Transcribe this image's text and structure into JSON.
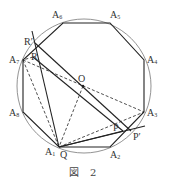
{
  "figure": {
    "caption": "図 2",
    "colors": {
      "line": "#222222",
      "circle": "#777777",
      "label": "#333333",
      "background": "#ffffff"
    },
    "circle": {
      "cx": 84,
      "cy": 86,
      "r": 67
    },
    "center": {
      "name": "O",
      "x": 83,
      "y": 86,
      "label_x": 78,
      "label_y": 82
    },
    "octagon": {
      "vertices": [
        {
          "name": "A1",
          "base": "A",
          "sub": "1",
          "x": 59,
          "y": 147,
          "lx": 45,
          "ly": 155
        },
        {
          "name": "A2",
          "base": "A",
          "sub": "2",
          "x": 110,
          "y": 147,
          "lx": 110,
          "ly": 158
        },
        {
          "name": "A3",
          "base": "A",
          "sub": "3",
          "x": 144,
          "y": 112,
          "lx": 147,
          "ly": 116
        },
        {
          "name": "A4",
          "base": "A",
          "sub": "4",
          "x": 144,
          "y": 60,
          "lx": 147,
          "ly": 63
        },
        {
          "name": "A5",
          "base": "A",
          "sub": "5",
          "x": 110,
          "y": 23,
          "lx": 110,
          "ly": 18
        },
        {
          "name": "A6",
          "base": "A",
          "sub": "6",
          "x": 63,
          "y": 23,
          "lx": 52,
          "ly": 18
        },
        {
          "name": "A7",
          "base": "A",
          "sub": "7",
          "x": 23,
          "y": 60,
          "lx": 9,
          "ly": 63
        },
        {
          "name": "A8",
          "base": "A",
          "sub": "8",
          "x": 23,
          "y": 112,
          "lx": 9,
          "ly": 116
        }
      ]
    },
    "points": [
      {
        "name": "Q",
        "x": 59,
        "y": 147,
        "label": "Q",
        "lx": 60,
        "ly": 158
      },
      {
        "name": "R'",
        "x": 35,
        "y": 43,
        "label": "R′",
        "lx": 24,
        "ly": 45
      },
      {
        "name": "R",
        "x": 33,
        "y": 57,
        "label": "R",
        "lx": 31,
        "ly": 60
      },
      {
        "name": "P",
        "x": 123,
        "y": 128,
        "label": "P",
        "lx": 113,
        "ly": 131
      },
      {
        "name": "P'",
        "x": 131,
        "y": 127,
        "label": "P′",
        "lx": 133,
        "ly": 140
      }
    ],
    "solid_lines": [
      {
        "from": "R'",
        "to": "A1",
        "x1": 32,
        "y1": 31,
        "x2": 59,
        "y2": 147
      },
      {
        "from": "R'",
        "to": "P'",
        "x1": 35,
        "y1": 43,
        "x2": 131,
        "y2": 131
      },
      {
        "from": "R",
        "to": "P",
        "x1": 33,
        "y1": 57,
        "x2": 123,
        "y2": 131
      },
      {
        "from": "A1",
        "to": "P'",
        "x1": 59,
        "y1": 147,
        "x2": 145,
        "y2": 126
      },
      {
        "from": "A1",
        "to": "P",
        "x1": 59,
        "y1": 147,
        "x2": 123,
        "y2": 131
      }
    ],
    "dashed_lines": [
      {
        "from": "A7",
        "to": "A1",
        "x1": 23,
        "y1": 60,
        "x2": 59,
        "y2": 147
      },
      {
        "from": "A7",
        "to": "A3",
        "x1": 23,
        "y1": 60,
        "x2": 144,
        "y2": 112
      },
      {
        "from": "O",
        "to": "A1",
        "x1": 83,
        "y1": 86,
        "x2": 59,
        "y2": 147
      },
      {
        "from": "A1",
        "to": "A3",
        "x1": 59,
        "y1": 147,
        "x2": 144,
        "y2": 112
      },
      {
        "from": "R",
        "to": "A7",
        "x1": 33,
        "y1": 57,
        "x2": 23,
        "y2": 60
      }
    ]
  }
}
